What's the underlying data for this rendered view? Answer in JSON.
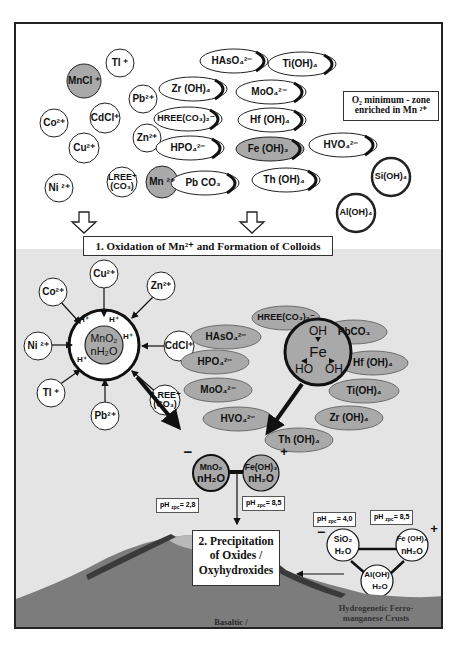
{
  "figure": {
    "upper_zone": {
      "note_box": {
        "line1": "O₂ minimum - zone",
        "line2": "enriched in Mn ²⁺"
      },
      "cations": [
        {
          "id": "tl",
          "label": "Tl ⁺",
          "fill": "white"
        },
        {
          "id": "mncl",
          "label": "MnCl ⁺",
          "fill": "gray"
        },
        {
          "id": "pb",
          "label": "Pb²⁺",
          "fill": "white"
        },
        {
          "id": "co",
          "label": "Co²⁺",
          "fill": "white"
        },
        {
          "id": "cdcl",
          "label": "CdCl⁺",
          "fill": "white"
        },
        {
          "id": "zn",
          "label": "Zn²⁺",
          "fill": "white"
        },
        {
          "id": "cu",
          "label": "Cu²⁺",
          "fill": "white"
        },
        {
          "id": "ni",
          "label": "Ni ²⁺",
          "fill": "white"
        },
        {
          "id": "lree",
          "label": "LREE⁺ (CO₃)",
          "fill": "white"
        },
        {
          "id": "mn",
          "label": "Mn ²⁺",
          "fill": "gray"
        }
      ],
      "anions": [
        {
          "id": "hasO4",
          "label": "HAsO₄²⁻",
          "fill": "white"
        },
        {
          "id": "tiOH4",
          "label": "Ti(OH)₄",
          "fill": "white"
        },
        {
          "id": "zrOH4",
          "label": "Zr (OH)₄",
          "fill": "white"
        },
        {
          "id": "moO4",
          "label": "MoO₄²⁻",
          "fill": "white"
        },
        {
          "id": "hreeCO3",
          "label": "HREE(CO₃)₂⁻",
          "fill": "white"
        },
        {
          "id": "hfOH4",
          "label": "Hf (OH)₄",
          "fill": "white"
        },
        {
          "id": "hpo4",
          "label": "HPO₄²⁻",
          "fill": "white"
        },
        {
          "id": "feOH3",
          "label": "Fe (OH)₃",
          "fill": "gray"
        },
        {
          "id": "hvo4",
          "label": "HVO₄²⁻",
          "fill": "white"
        },
        {
          "id": "pbCO3",
          "label": "Pb CO₃",
          "fill": "white"
        },
        {
          "id": "thOH4",
          "label": "Th (OH)₄",
          "fill": "white"
        },
        {
          "id": "siOH4",
          "label": "Si(OH)₄",
          "fill": "white"
        },
        {
          "id": "alOH4",
          "label": "Al(OH)₄",
          "fill": "white"
        }
      ]
    },
    "step1": {
      "label": "1. Oxidation of Mn²⁺ and Formation of Colloids"
    },
    "mn_colloid": {
      "core": {
        "line1": "MnO₂",
        "line2": "nH₂O"
      },
      "protons": [
        "H⁺",
        "H⁺",
        "H⁺",
        "H⁺"
      ],
      "adsorbed": [
        "Cu²⁺",
        "Zn²⁺",
        "CdCl⁺",
        "LREE⁺ (CO₃)",
        "Pb²⁺",
        "Tl ⁺",
        "Ni ²⁺",
        "Co²⁺"
      ]
    },
    "fe_colloid": {
      "core": {
        "top": "OH",
        "center": "Fe",
        "left": "HO",
        "right": "OH"
      },
      "adsorbed": [
        "HREE(CO₃)₂⁻",
        "PbCO₃",
        "HAsO₄²⁻",
        "Hf (OH)₄",
        "HPO₄²⁻",
        "Ti(OH)₄",
        "MoO₄²⁻",
        "Zr (OH)₄",
        "HVO₄²⁻",
        "Th (OH)₄"
      ]
    },
    "coupled_colloid": {
      "mn": {
        "line1": "MnO₂",
        "line2": "nH₂O",
        "charge": "−",
        "ph_label": "pH",
        "ph_sub": "zpc",
        "ph_value": "= 2,8"
      },
      "fe": {
        "line1": "Fe(OH)₃",
        "line2": "nH₂O",
        "charge": "+",
        "ph_label": "pH",
        "ph_sub": "zpc",
        "ph_value": "= 8,5"
      }
    },
    "crust_colloid": {
      "si": {
        "line1": "SiO₂",
        "line2": "H₂O",
        "charge": "−",
        "ph_label": "pH",
        "ph_sub": "zpc",
        "ph_value": "= 4,0"
      },
      "fe": {
        "line1": "Fe (OH)₃",
        "line2": "nH₂O",
        "charge": "+",
        "ph_label": "pH",
        "ph_sub": "zpc",
        "ph_value": "= 8,5"
      },
      "al": {
        "line1": "Al(OH)",
        "line2": "H₂O"
      }
    },
    "step2": {
      "line1": "2. Precipitation",
      "line2": "of Oxides /",
      "line3": "Oxyhydroxides"
    },
    "crust_label": {
      "line1": "Hydrogenetic Ferro-",
      "line2": "manganese Crusts"
    },
    "rock_label": {
      "line1": "Basaltic /",
      "line2": "Calcareous Substrate Rocks"
    },
    "colors": {
      "gray_fill": "#a9a9a9",
      "lower_bg": "#e4e4e4",
      "rock": "#7c7c7c",
      "crust": "#3a3a3a",
      "cap": "#b8b8b8"
    }
  }
}
